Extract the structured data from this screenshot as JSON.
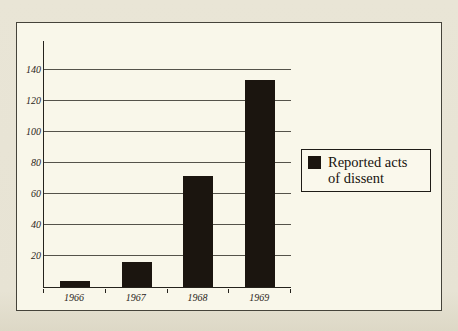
{
  "page": {
    "background_color": "#e8e4d5",
    "frame_background_color": "#f9f7ea"
  },
  "chart_data": {
    "type": "bar",
    "title": "",
    "xlabel": "",
    "ylabel": "",
    "categories": [
      "1966",
      "1967",
      "1968",
      "1969"
    ],
    "values": [
      4,
      16,
      72,
      134
    ],
    "series_name": "Reported acts of dissent",
    "yticks": [
      20,
      40,
      60,
      80,
      100,
      120,
      140
    ],
    "ylim": [
      0,
      159
    ],
    "grid": true,
    "bar_color": "#1b150f",
    "legend_position": "right",
    "legend_lines": [
      "Reported acts",
      "of dissent"
    ]
  }
}
